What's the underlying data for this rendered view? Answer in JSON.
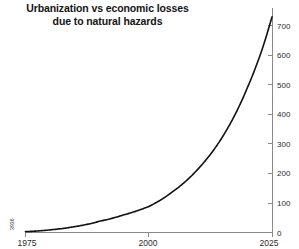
{
  "chart_data": {
    "type": "line",
    "title": "Urbanization vs economic losses\ndue to natural hazards",
    "xlabel": "",
    "ylabel": "",
    "xlim": [
      1975,
      2025
    ],
    "ylim": [
      0,
      760
    ],
    "grid": false,
    "legend": "none",
    "y_axis_position": "right",
    "x_ticks": [
      1975,
      2000,
      2025
    ],
    "x_tick_labels": [
      "1975",
      "2000",
      "2025"
    ],
    "y_ticks": [
      0,
      100,
      200,
      300,
      400,
      500,
      600,
      700
    ],
    "y_tick_labels": [
      "0",
      "100",
      "200",
      "300",
      "400",
      "500",
      "600",
      "700"
    ],
    "annotations": [
      {
        "text": "3936",
        "x": 1975,
        "y": 40,
        "rotation": -90,
        "name": "origin-note"
      }
    ],
    "series": [
      {
        "name": "economic losses",
        "color": "#111111",
        "x": [
          1975,
          1980,
          1985,
          1990,
          1995,
          2000,
          2005,
          2010,
          2015,
          2020,
          2023,
          2025
        ],
        "values": [
          3,
          9,
          20,
          38,
          60,
          88,
          140,
          215,
          325,
          490,
          620,
          730
        ]
      }
    ]
  },
  "colors": {
    "background": "#ffffff",
    "axis": "#8a8a8a",
    "line": "#111111",
    "text": "#1a1a1a"
  }
}
